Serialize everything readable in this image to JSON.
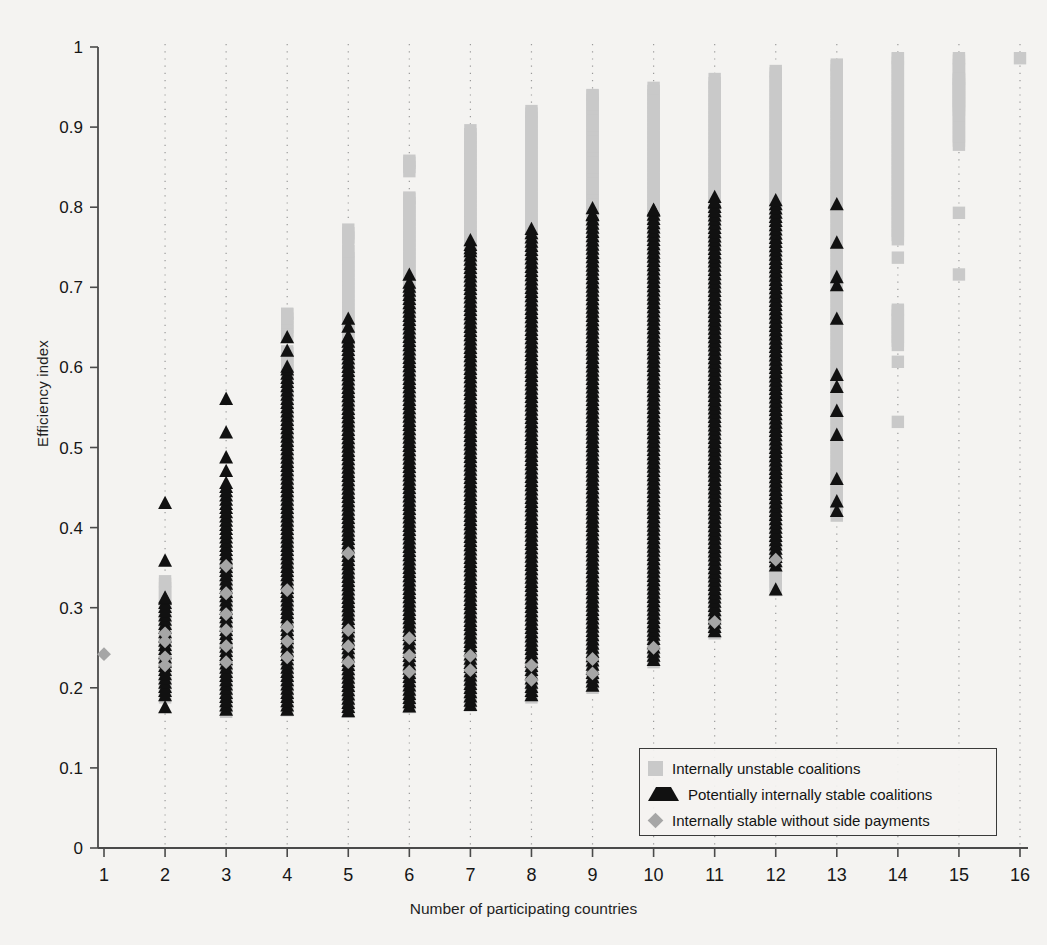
{
  "chart_data": {
    "type": "scatter",
    "title": "",
    "xlabel": "Number of participating countries",
    "ylabel": "Efficiency index",
    "xlim": [
      1,
      16
    ],
    "ylim": [
      0,
      1
    ],
    "xticks": [
      "1",
      "2",
      "3",
      "4",
      "5",
      "6",
      "7",
      "8",
      "9",
      "10",
      "11",
      "12",
      "13",
      "14",
      "15",
      "16"
    ],
    "yticks": [
      "0",
      "0.1",
      "0.2",
      "0.3",
      "0.4",
      "0.5",
      "0.6",
      "0.7",
      "0.8",
      "0.9",
      "1"
    ],
    "grid": "vertical dotted gridlines at every integer x",
    "legend_position": "inside lower-right",
    "legend": [
      {
        "marker": "square",
        "color": "#c9c9c9",
        "label": "Internally unstable coalitions"
      },
      {
        "marker": "triangle",
        "color": "#111111",
        "label": "Potentially internally stable coalitions"
      },
      {
        "marker": "diamond",
        "color": "#a6a6a6",
        "label": "Internally stable without side payments"
      }
    ],
    "series": [
      {
        "name": "Internally unstable coalitions",
        "marker": "square",
        "color": "#c9c9c9",
        "columns": [
          {
            "x": 2,
            "ranges": [
              [
                0.188,
                0.333
              ]
            ],
            "points": []
          },
          {
            "x": 3,
            "ranges": [
              [
                0.17,
                0.358
              ]
            ],
            "points": []
          },
          {
            "x": 4,
            "ranges": [
              [
                0.172,
                0.62
              ],
              [
                0.64,
                0.667
              ]
            ],
            "points": []
          },
          {
            "x": 5,
            "ranges": [
              [
                0.17,
                0.745
              ],
              [
                0.757,
                0.772
              ]
            ],
            "points": []
          },
          {
            "x": 6,
            "ranges": [
              [
                0.176,
                0.812
              ],
              [
                0.845,
                0.858
              ]
            ],
            "points": []
          },
          {
            "x": 7,
            "ranges": [
              [
                0.178,
                0.896
              ]
            ],
            "points": []
          },
          {
            "x": 8,
            "ranges": [
              [
                0.188,
                0.92
              ]
            ],
            "points": []
          },
          {
            "x": 9,
            "ranges": [
              [
                0.2,
                0.94
              ]
            ],
            "points": []
          },
          {
            "x": 10,
            "ranges": [
              [
                0.232,
                0.949
              ]
            ],
            "points": []
          },
          {
            "x": 11,
            "ranges": [
              [
                0.268,
                0.96
              ]
            ],
            "points": []
          },
          {
            "x": 12,
            "ranges": [
              [
                0.322,
                0.97
              ]
            ],
            "points": []
          },
          {
            "x": 13,
            "ranges": [
              [
                0.415,
                0.978
              ]
            ],
            "points": []
          },
          {
            "x": 14,
            "ranges": [
              [
                0.76,
                0.986
              ],
              [
                0.628,
                0.672
              ]
            ],
            "points": [
              0.737,
              0.607,
              0.532
            ]
          },
          {
            "x": 15,
            "ranges": [
              [
                0.878,
                0.986
              ],
              [
                0.922,
                0.96
              ]
            ],
            "points": [
              0.793,
              0.716
            ]
          },
          {
            "x": 16,
            "ranges": [],
            "points": [
              0.986
            ]
          }
        ]
      },
      {
        "name": "Potentially internally stable coalitions",
        "marker": "triangle",
        "color": "#111111",
        "columns": [
          {
            "x": 2,
            "ranges": [
              [
                0.19,
                0.312
              ]
            ],
            "points": [
              0.43,
              0.358,
              0.175
            ]
          },
          {
            "x": 3,
            "ranges": [
              [
                0.172,
                0.455
              ]
            ],
            "points": [
              0.56,
              0.518,
              0.487,
              0.47
            ]
          },
          {
            "x": 4,
            "ranges": [
              [
                0.172,
                0.6
              ]
            ],
            "points": [
              0.637,
              0.62
            ]
          },
          {
            "x": 5,
            "ranges": [
              [
                0.17,
                0.638
              ]
            ],
            "points": [
              0.66,
              0.65
            ]
          },
          {
            "x": 6,
            "ranges": [
              [
                0.176,
                0.7
              ]
            ],
            "points": [
              0.715,
              0.705
            ]
          },
          {
            "x": 7,
            "ranges": [
              [
                0.178,
                0.748
              ]
            ],
            "points": [
              0.758,
              0.752
            ]
          },
          {
            "x": 8,
            "ranges": [
              [
                0.19,
                0.772
              ]
            ],
            "points": []
          },
          {
            "x": 9,
            "ranges": [
              [
                0.202,
                0.79
              ]
            ],
            "points": [
              0.798
            ]
          },
          {
            "x": 10,
            "ranges": [
              [
                0.234,
                0.796
              ]
            ],
            "points": []
          },
          {
            "x": 11,
            "ranges": [
              [
                0.27,
                0.806
              ]
            ],
            "points": [
              0.812
            ]
          },
          {
            "x": 12,
            "ranges": [
              [
                0.352,
                0.808
              ]
            ],
            "points": [
              0.322
            ]
          },
          {
            "x": 13,
            "ranges": [],
            "points": [
              0.803,
              0.755,
              0.712,
              0.702,
              0.66,
              0.59,
              0.575,
              0.545,
              0.515,
              0.46,
              0.432,
              0.42
            ]
          },
          {
            "x": 14,
            "ranges": [],
            "points": []
          },
          {
            "x": 15,
            "ranges": [],
            "points": []
          },
          {
            "x": 16,
            "ranges": [],
            "points": []
          }
        ]
      },
      {
        "name": "Internally stable without side payments",
        "marker": "diamond",
        "color": "#a6a6a6",
        "columns": [
          {
            "x": 1,
            "ranges": [],
            "points": [
              0.242
            ]
          },
          {
            "x": 2,
            "ranges": [],
            "points": [
              0.268,
              0.258,
              0.238,
              0.228
            ]
          },
          {
            "x": 3,
            "ranges": [],
            "points": [
              0.352,
              0.318,
              0.292,
              0.272,
              0.252,
              0.232
            ]
          },
          {
            "x": 4,
            "ranges": [],
            "points": [
              0.322,
              0.276,
              0.258,
              0.238
            ]
          },
          {
            "x": 5,
            "ranges": [],
            "points": [
              0.368,
              0.272,
              0.252,
              0.232
            ]
          },
          {
            "x": 6,
            "ranges": [],
            "points": [
              0.262,
              0.24,
              0.22
            ]
          },
          {
            "x": 7,
            "ranges": [],
            "points": [
              0.24,
              0.222
            ]
          },
          {
            "x": 8,
            "ranges": [],
            "points": [
              0.228,
              0.21
            ]
          },
          {
            "x": 9,
            "ranges": [],
            "points": [
              0.236,
              0.218
            ]
          },
          {
            "x": 10,
            "ranges": [],
            "points": [
              0.25
            ]
          },
          {
            "x": 11,
            "ranges": [],
            "points": [
              0.282
            ]
          },
          {
            "x": 12,
            "ranges": [],
            "points": [
              0.36
            ]
          },
          {
            "x": 13,
            "ranges": [],
            "points": []
          },
          {
            "x": 14,
            "ranges": [],
            "points": []
          },
          {
            "x": 15,
            "ranges": [],
            "points": []
          },
          {
            "x": 16,
            "ranges": [],
            "points": []
          }
        ]
      }
    ]
  },
  "axes": {
    "y_title": "Efficiency index",
    "x_title": "Number of participating countries"
  },
  "legend": {
    "items": [
      {
        "label": "Internally unstable coalitions"
      },
      {
        "label": "Potentially internally stable coalitions"
      },
      {
        "label": "Internally stable without side payments"
      }
    ]
  }
}
